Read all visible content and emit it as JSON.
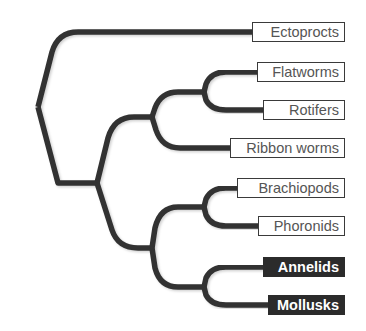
{
  "diagram": {
    "type": "phylogenetic-tree",
    "colors": {
      "branch": "#333333",
      "label_border": "#3a3a3a",
      "label_text": "#555555",
      "highlight_bg": "#2b2b2b",
      "highlight_text": "#ffffff"
    },
    "taxa": [
      {
        "name": "Ectoprocts",
        "highlighted": false
      },
      {
        "name": "Flatworms",
        "highlighted": false
      },
      {
        "name": "Rotifers",
        "highlighted": false
      },
      {
        "name": "Ribbon worms",
        "highlighted": false
      },
      {
        "name": "Brachiopods",
        "highlighted": false
      },
      {
        "name": "Phoronids",
        "highlighted": false
      },
      {
        "name": "Annelids",
        "highlighted": true
      },
      {
        "name": "Mollusks",
        "highlighted": true
      }
    ],
    "topology": "(Ectoprocts,(((Flatworms,Rotifers),Ribbon worms),((Brachiopods,Phoronids),(Annelids,Mollusks))))"
  }
}
